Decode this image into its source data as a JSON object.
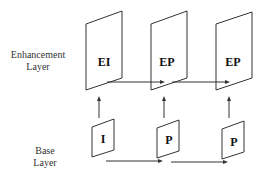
{
  "title": "",
  "labels": {
    "enhancement_line1": "Enhancement",
    "enhancement_line2": "Layer",
    "base_line1": "Base",
    "base_line2": "Layer"
  },
  "enhancement_frames": [
    {
      "label": "EI"
    },
    {
      "label": "EP"
    },
    {
      "label": "EP"
    }
  ],
  "base_frames": [
    {
      "label": "I"
    },
    {
      "label": "P"
    },
    {
      "label": "P"
    }
  ],
  "connections": [
    {
      "from": "base_frames.0",
      "to": "enhancement_frames.0",
      "type": "upward"
    },
    {
      "from": "base_frames.1",
      "to": "enhancement_frames.1",
      "type": "upward"
    },
    {
      "from": "base_frames.2",
      "to": "enhancement_frames.2",
      "type": "upward"
    },
    {
      "from": "enhancement_frames.0",
      "to": "enhancement_frames.1",
      "type": "forward"
    },
    {
      "from": "enhancement_frames.1",
      "to": "enhancement_frames.2",
      "type": "forward"
    },
    {
      "from": "base_frames.0",
      "to": "base_frames.1",
      "type": "forward"
    },
    {
      "from": "base_frames.1",
      "to": "base_frames.2",
      "type": "forward"
    }
  ],
  "colors": {
    "stroke": "#333333",
    "background": "#ffffff"
  }
}
